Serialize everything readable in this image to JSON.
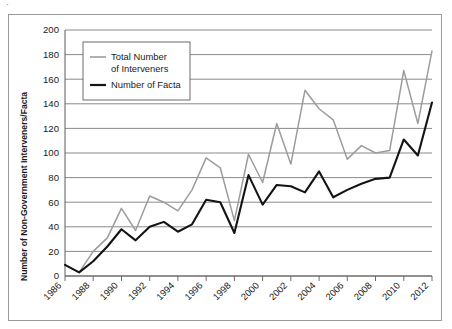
{
  "figure": {
    "frame_border_color": "#9a9a9a",
    "background": "#ffffff"
  },
  "chart_data": {
    "type": "line",
    "title": "",
    "xlabel": "",
    "ylabel": "Number of Non-Government Interveners/Facta",
    "xlim": [
      1986,
      2012
    ],
    "ylim": [
      0,
      200
    ],
    "grid": true,
    "legend_position": "upper-left-inside",
    "x": [
      1986,
      1987,
      1988,
      1989,
      1990,
      1991,
      1992,
      1993,
      1994,
      1995,
      1996,
      1997,
      1998,
      1999,
      2000,
      2001,
      2002,
      2003,
      2004,
      2005,
      2006,
      2007,
      2008,
      2009,
      2010,
      2011,
      2012
    ],
    "xtick_labels": [
      "1986",
      "1988",
      "1990",
      "1992",
      "1994",
      "1996",
      "1998",
      "2000",
      "2002",
      "2004",
      "2006",
      "2008",
      "2010",
      "2012"
    ],
    "xtick_values": [
      1986,
      1988,
      1990,
      1992,
      1994,
      1996,
      1998,
      2000,
      2002,
      2004,
      2006,
      2008,
      2010,
      2012
    ],
    "ytick_labels": [
      "0",
      "20",
      "40",
      "60",
      "80",
      "100",
      "120",
      "140",
      "160",
      "180",
      "200"
    ],
    "ytick_values": [
      0,
      20,
      40,
      60,
      80,
      100,
      120,
      140,
      160,
      180,
      200
    ],
    "series": [
      {
        "name": "Total Number of Interveners",
        "color": "#9c9c9c",
        "legend_label_line1": "Total Number",
        "legend_label_line2": "of Interveners",
        "values": [
          9,
          3,
          20,
          31,
          55,
          37,
          65,
          60,
          53,
          70,
          96,
          88,
          45,
          99,
          76,
          124,
          91,
          151,
          136,
          127,
          95,
          106,
          100,
          102,
          167,
          124,
          183
        ]
      },
      {
        "name": "Number of Facta",
        "color": "#141414",
        "legend_label_line1": "Number of Facta",
        "legend_label_line2": "",
        "values": [
          9,
          3,
          12,
          24,
          38,
          29,
          40,
          44,
          36,
          42,
          62,
          60,
          35,
          82,
          58,
          74,
          73,
          68,
          85,
          64,
          70,
          75,
          79,
          80,
          111,
          98,
          141
        ]
      }
    ]
  },
  "legend": {
    "entries": [
      {
        "label_line1": "Total Number",
        "label_line2": "of Interveners",
        "color": "#9c9c9c"
      },
      {
        "label_line1": "Number of Facta",
        "label_line2": "",
        "color": "#141414"
      }
    ]
  }
}
